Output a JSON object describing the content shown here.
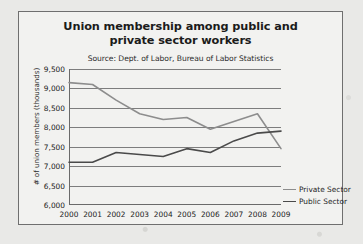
{
  "chart_data": {
    "type": "line",
    "title": "Union membership among public and private sector workers",
    "subtitle": "Source: Dept. of Labor, Bureau of Labor Statistics",
    "xlabel": "",
    "ylabel": "# of union members (thousands)",
    "categories": [
      "2000",
      "2001",
      "2002",
      "2003",
      "2004",
      "2005",
      "2006",
      "2007",
      "2008",
      "2009"
    ],
    "ylim": [
      6000,
      9500
    ],
    "yticks": [
      9500,
      9000,
      8500,
      8000,
      7500,
      7000,
      6500,
      6000
    ],
    "ytick_labels": [
      "9,500",
      "9,000",
      "8,500",
      "8,000",
      "7,500",
      "7,000",
      "6,500",
      "6,000"
    ],
    "grid": true,
    "legend_position": "right",
    "series": [
      {
        "name": "Private Sector",
        "color": "#8d8d8d",
        "values": [
          9150,
          9100,
          8700,
          8350,
          8200,
          8250,
          7950,
          8150,
          8350,
          7450
        ]
      },
      {
        "name": "Public Sector",
        "color": "#4a4a4a",
        "values": [
          7100,
          7100,
          7350,
          7300,
          7250,
          7450,
          7350,
          7650,
          7850,
          7900
        ]
      }
    ]
  }
}
